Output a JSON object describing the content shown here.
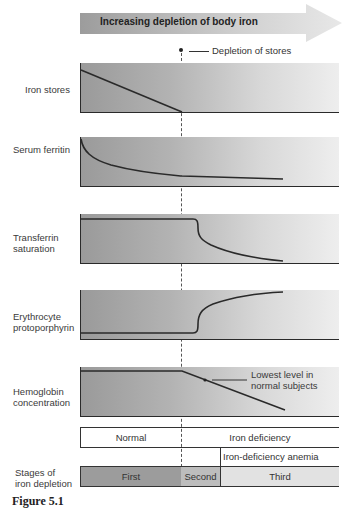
{
  "header": {
    "arrow_label": "Increasing depletion of body iron",
    "marker_label": "Depletion of stores"
  },
  "panels": [
    {
      "id": "iron-stores",
      "label": "Iron stores"
    },
    {
      "id": "serum-ferritin",
      "label": "Serum ferritin"
    },
    {
      "id": "transferrin-saturation",
      "label_line1": "Transferrin",
      "label_line2": "saturation"
    },
    {
      "id": "erythrocyte-protoporphyrin",
      "label_line1": "Erythrocyte",
      "label_line2": "protoporphyrin"
    },
    {
      "id": "hemoglobin-concentration",
      "label_line1": "Hemoglobin",
      "label_line2": "concentration"
    }
  ],
  "hemoglobin_annotation": {
    "line1": "Lowest level in",
    "line2": "normal subjects"
  },
  "stages": {
    "row_label_line1": "Stages of",
    "row_label_line2": "iron depletion",
    "status_normal": "Normal",
    "status_deficiency": "Iron deficiency",
    "status_anemia": "Iron-deficiency anemia",
    "first": "First",
    "second": "Second",
    "third": "Third"
  },
  "caption": "Figure 5.1",
  "colors": {
    "panel_dark": "#9a9a9a",
    "panel_light": "#eeeeee",
    "line": "#2a2a2a",
    "stage_first": "#9c9c9c",
    "stage_second": "#bdbdbd",
    "stage_third": "#e2e2e2"
  }
}
